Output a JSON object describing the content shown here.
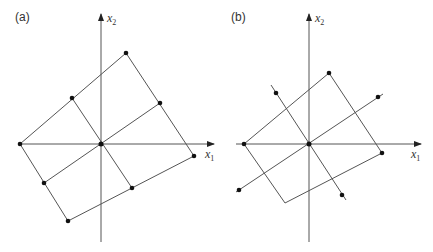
{
  "figure": {
    "panels": [
      {
        "label": "(a)",
        "x_axis_label": "x",
        "x_axis_sub": "1",
        "y_axis_label": "x",
        "y_axis_sub": "2"
      },
      {
        "label": "(b)",
        "x_axis_label": "x",
        "x_axis_sub": "1",
        "y_axis_label": "x",
        "y_axis_sub": "2"
      }
    ]
  },
  "colors": {
    "line": "#555555",
    "point": "#111111",
    "background": "#ffffff"
  }
}
